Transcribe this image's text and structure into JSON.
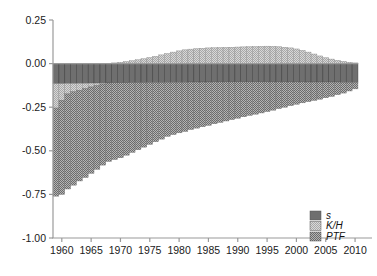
{
  "chart_data": {
    "type": "bar",
    "stacked": true,
    "title": "",
    "subtitle": "",
    "xlabel": "",
    "ylabel": "",
    "xlim": [
      1958.5,
      2010.5
    ],
    "ylim": [
      -1.0,
      0.25
    ],
    "grid": false,
    "legend_position": "bottom-right",
    "yticks": [
      "0.25",
      "0.00",
      "-0.25",
      "-0.50",
      "-0.75",
      "-1.00"
    ],
    "ytick_values": [
      0.25,
      0.0,
      -0.25,
      -0.5,
      -0.75,
      -1.0
    ],
    "xticks": [
      "1960",
      "1965",
      "1970",
      "1975",
      "1980",
      "1985",
      "1990",
      "1995",
      "2000",
      "2005",
      "2010"
    ],
    "xtick_values": [
      1960,
      1965,
      1970,
      1975,
      1980,
      1985,
      1990,
      1995,
      2000,
      2005,
      2010
    ],
    "legend": [
      {
        "name": "s",
        "pattern": "solid-dark",
        "color": "#6e6e6e"
      },
      {
        "name": "K/H",
        "pattern": "light-check",
        "color": "#c9c9c9"
      },
      {
        "name": "PTF",
        "pattern": "medium-check",
        "color": "#9a9a9a"
      }
    ],
    "x": [
      1959,
      1960,
      1961,
      1962,
      1963,
      1964,
      1965,
      1966,
      1967,
      1968,
      1969,
      1970,
      1971,
      1972,
      1973,
      1974,
      1975,
      1976,
      1977,
      1978,
      1979,
      1980,
      1981,
      1982,
      1983,
      1984,
      1985,
      1986,
      1987,
      1988,
      1989,
      1990,
      1991,
      1992,
      1993,
      1994,
      1995,
      1996,
      1997,
      1998,
      1999,
      2000,
      2001,
      2002,
      2003,
      2004,
      2005,
      2006,
      2007,
      2008,
      2009,
      2010
    ],
    "series": [
      {
        "name": "s",
        "values": [
          -0.115,
          -0.115,
          -0.114,
          -0.114,
          -0.113,
          -0.113,
          -0.112,
          -0.112,
          -0.111,
          -0.111,
          -0.11,
          -0.11,
          -0.11,
          -0.109,
          -0.109,
          -0.109,
          -0.108,
          -0.108,
          -0.108,
          -0.107,
          -0.107,
          -0.107,
          -0.107,
          -0.106,
          -0.106,
          -0.106,
          -0.106,
          -0.105,
          -0.105,
          -0.105,
          -0.105,
          -0.105,
          -0.105,
          -0.105,
          -0.105,
          -0.105,
          -0.105,
          -0.105,
          -0.105,
          -0.105,
          -0.105,
          -0.105,
          -0.105,
          -0.106,
          -0.106,
          -0.106,
          -0.106,
          -0.106,
          -0.106,
          -0.107,
          -0.107,
          -0.107
        ]
      },
      {
        "name": "K/H",
        "values": [
          -0.14,
          -0.095,
          -0.06,
          -0.048,
          -0.04,
          -0.03,
          -0.022,
          -0.014,
          -0.006,
          0.0,
          0.004,
          0.008,
          0.012,
          0.017,
          0.022,
          0.028,
          0.035,
          0.042,
          0.05,
          0.058,
          0.066,
          0.073,
          0.079,
          0.083,
          0.086,
          0.088,
          0.09,
          0.091,
          0.092,
          0.093,
          0.094,
          0.095,
          0.096,
          0.097,
          0.098,
          0.099,
          0.1,
          0.099,
          0.097,
          0.094,
          0.09,
          0.084,
          0.076,
          0.066,
          0.055,
          0.044,
          0.034,
          0.026,
          0.019,
          0.013,
          0.008,
          0.004
        ]
      },
      {
        "name": "PTF",
        "values": [
          -0.505,
          -0.54,
          -0.545,
          -0.535,
          -0.52,
          -0.51,
          -0.495,
          -0.48,
          -0.465,
          -0.45,
          -0.44,
          -0.43,
          -0.415,
          -0.4,
          -0.385,
          -0.37,
          -0.355,
          -0.34,
          -0.325,
          -0.31,
          -0.3,
          -0.29,
          -0.282,
          -0.272,
          -0.264,
          -0.256,
          -0.248,
          -0.24,
          -0.232,
          -0.224,
          -0.216,
          -0.208,
          -0.2,
          -0.192,
          -0.185,
          -0.178,
          -0.17,
          -0.162,
          -0.153,
          -0.145,
          -0.136,
          -0.128,
          -0.12,
          -0.112,
          -0.105,
          -0.098,
          -0.09,
          -0.082,
          -0.072,
          -0.062,
          -0.05,
          -0.038
        ]
      }
    ]
  }
}
